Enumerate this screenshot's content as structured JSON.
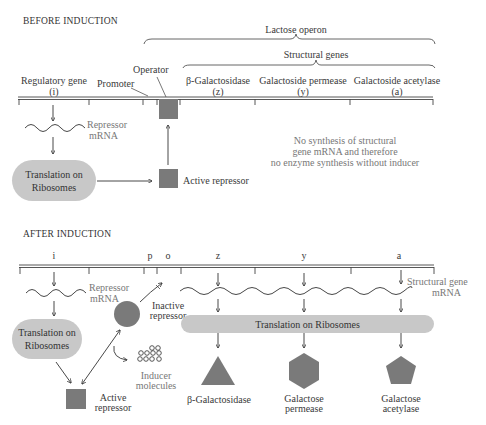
{
  "before": {
    "title": "BEFORE INDUCTION",
    "lactose_operon_label": "Lactose operon",
    "structural_genes_label": "Structural genes",
    "regulatory_gene": {
      "name": "Regulatory gene",
      "code": "(i)"
    },
    "promoter_label": "Promoter",
    "operator_label": "Operator",
    "genes": [
      {
        "name": "β-Galactosidase",
        "code": "(z)"
      },
      {
        "name": "Galactoside permease",
        "code": "(y)"
      },
      {
        "name": "Galactoside acetylase",
        "code": "(a)"
      }
    ],
    "repressor_mrna_line1": "Repressor",
    "repressor_mrna_line2": "mRNA",
    "translation_line1": "Translation on",
    "translation_line2": "Ribosomes",
    "active_repressor_label": "Active repressor",
    "note_line1": "No synthesis of structural",
    "note_line2": "gene mRNA and  therefore",
    "note_line3": "no enzyme synthesis without inducer"
  },
  "after": {
    "title": "AFTER INDUCTION",
    "gene_letters": {
      "i": "i",
      "p": "p",
      "o": "o",
      "z": "z",
      "y": "y",
      "a": "a"
    },
    "repressor_mrna_line1": "Repressor",
    "repressor_mrna_line2": "mRNA",
    "translation_line1": "Translation on",
    "translation_line2": "Ribosomes",
    "inactive_repressor_line1": "Inactive",
    "inactive_repressor_line2": "repressor",
    "inducer_line1": "Inducer",
    "inducer_line2": "molecules",
    "active_repressor_line1": "Active",
    "active_repressor_line2": "repressor",
    "structural_mrna_line1": "Structural gene",
    "structural_mrna_line2": "mRNA",
    "translation_bar_label": "Translation on Ribosomes",
    "products": [
      {
        "shape": "triangle",
        "line1": "β-Galactosidase",
        "line2": ""
      },
      {
        "shape": "hexagon",
        "line1": "Galactose",
        "line2": "permease"
      },
      {
        "shape": "pentagon",
        "line1": "Galactose",
        "line2": "acetylase"
      }
    ]
  },
  "colors": {
    "repressor_fill": "#7a7a7a",
    "ribosome_fill": "#c8c8c8",
    "line": "#444444"
  }
}
